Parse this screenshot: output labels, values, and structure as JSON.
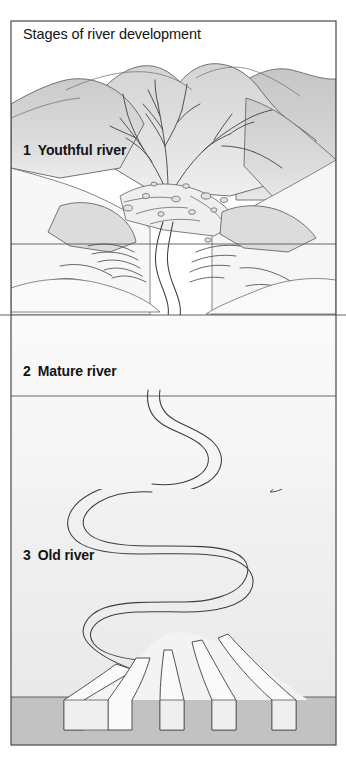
{
  "figure": {
    "title": "Stages of river development",
    "frame": {
      "x": 11,
      "y": 21,
      "width": 325,
      "height": 724
    },
    "background_color": "#ffffff",
    "line_color": "#3a3a3a",
    "text_color": "#141414"
  },
  "stages": [
    {
      "number": "1",
      "label": "Youthful river",
      "label_text": "1  Youthful river",
      "description_icon": "mountain-icon",
      "band_top": 21,
      "band_bottom": 315
    },
    {
      "number": "2",
      "label": "Mature river",
      "label_text": "2  Mature river",
      "description_icon": "valley-icon",
      "band_top": 315,
      "band_bottom": 489
    },
    {
      "number": "3",
      "label": "Old river",
      "label_text": "3  Old river",
      "description_icon": "delta-icon",
      "band_top": 489,
      "band_bottom": 745
    }
  ],
  "features": [
    {
      "name": "dendritic-drainage",
      "stage": "1"
    },
    {
      "name": "mountain-ridges",
      "stage": "1"
    },
    {
      "name": "alluvial-fan-scree",
      "stage": "1"
    },
    {
      "name": "v-shaped-valley",
      "stage": "2"
    },
    {
      "name": "tributary-streams",
      "stage": "2"
    },
    {
      "name": "flood-plain",
      "stage": "3"
    },
    {
      "name": "meander-loops",
      "stage": "3"
    },
    {
      "name": "oxbow-lake",
      "stage": "3"
    },
    {
      "name": "river-delta",
      "stage": "3"
    },
    {
      "name": "sea",
      "stage": "3"
    }
  ],
  "colors": {
    "ink": "#3a3a3a",
    "shade_light": "#f0f0f0",
    "shade_mid": "#e0e0e0",
    "shade_dark": "#c9c9c9",
    "sea": "#c2c2c2",
    "paper": "#ffffff"
  },
  "dividers": [
    {
      "name": "stage-1-inner-divider",
      "y": 244,
      "extends_outside": false
    },
    {
      "name": "stage-1-2-divider",
      "y": 315,
      "extends_outside": true
    },
    {
      "name": "stage-2-inner-divider",
      "y": 396,
      "extends_outside": false
    }
  ]
}
